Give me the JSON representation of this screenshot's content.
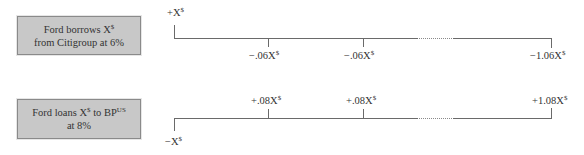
{
  "rows": [
    {
      "box": {
        "line1_prefix": "Ford borrows X",
        "line1_sup": "$",
        "line2": "from Citigroup at 6%"
      },
      "timeline": {
        "start_label": "+X",
        "start_sup": "$",
        "flows": [
          {
            "label": "−.06X",
            "sup": "$"
          },
          {
            "label": "−.06X",
            "sup": "$"
          },
          {
            "label": "−1.06X",
            "sup": "$"
          }
        ]
      }
    },
    {
      "box": {
        "line1_prefix": "Ford loans X",
        "line1_sup": "$",
        "line1_mid": " to BP",
        "line1_sup2": "US",
        "line2": "at 8%"
      },
      "timeline": {
        "start_label": "−X",
        "start_sup": "$",
        "flows": [
          {
            "label": "+.08X",
            "sup": "$"
          },
          {
            "label": "+.08X",
            "sup": "$"
          },
          {
            "label": "+1.08X",
            "sup": "$"
          }
        ]
      }
    }
  ],
  "colors": {
    "box_fill": "#c8c8c8",
    "box_border": "#8a8a8a",
    "line": "#6a6a6a",
    "text": "#333333"
  }
}
